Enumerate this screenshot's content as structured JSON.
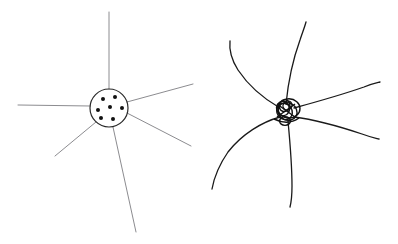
{
  "document": {
    "title": "Hand-drawn node diagram comparison",
    "background_color": "#ffffff",
    "width": 398,
    "height": 244
  },
  "panels": [
    {
      "id": "left-panel",
      "name": "clean-node-diagram",
      "caption": "",
      "description": "Clean thin-line star: circle hub containing seven dots with six straight rays radiating outward",
      "stroke_color": "#8c8c90",
      "stroke_width": 1.0,
      "hub": {
        "name": "hub-circle",
        "cx": 109,
        "cy": 108,
        "r": 19,
        "fill": "none",
        "stroke_color": "#2a2a2a",
        "stroke_width": 1.2
      },
      "dots": {
        "name": "hub-dots",
        "count": 7,
        "radius": 2.0,
        "color": "#111111",
        "points": [
          {
            "cx": 103,
            "cy": 99
          },
          {
            "cx": 115,
            "cy": 97
          },
          {
            "cx": 98,
            "cy": 110
          },
          {
            "cx": 110,
            "cy": 107
          },
          {
            "cx": 122,
            "cy": 108
          },
          {
            "cx": 101,
            "cy": 118
          },
          {
            "cx": 113,
            "cy": 119
          }
        ]
      },
      "rays": [
        {
          "name": "ray-north",
          "x1": 109,
          "y1": 89,
          "x2": 109,
          "y2": 12
        },
        {
          "name": "ray-west",
          "x1": 90,
          "y1": 106,
          "x2": 18,
          "y2": 105
        },
        {
          "name": "ray-northeast",
          "x1": 127,
          "y1": 102,
          "x2": 193,
          "y2": 84
        },
        {
          "name": "ray-east-down",
          "x1": 127,
          "y1": 113,
          "x2": 191,
          "y2": 146
        },
        {
          "name": "ray-southwest",
          "x1": 96,
          "y1": 122,
          "x2": 55,
          "y2": 156
        },
        {
          "name": "ray-south",
          "x1": 113,
          "y1": 127,
          "x2": 136,
          "y2": 232
        }
      ]
    },
    {
      "id": "right-panel",
      "name": "sketchy-node-diagram",
      "caption": "",
      "description": "Messy hand-drawn star: tangled scribbled knot hub with six curved, wobbly strokes radiating outward",
      "stroke_color": "#1a1a1a",
      "stroke_width": 1.3,
      "hub": {
        "name": "hub-knot",
        "cx": 286,
        "cy": 110,
        "r": 11,
        "fill": "none",
        "stroke_color": "#111111",
        "stroke_width": 1.4,
        "scribble_loops": 6
      },
      "rays": [
        {
          "name": "curve-north",
          "d": "M 286 104 C 288 84 292 62 300 40 C 303 31 305 26 306 22"
        },
        {
          "name": "curve-northwest",
          "d": "M 280 108 C 266 100 250 88 238 70 C 231 59 229 50 230 41"
        },
        {
          "name": "curve-northeast",
          "d": "M 294 108 C 316 102 344 94 364 87 C 371 84 376 83 380 82"
        },
        {
          "name": "curve-east",
          "d": "M 294 117 C 318 120 344 128 362 134 C 370 137 375 138 379 139"
        },
        {
          "name": "curve-southwest",
          "d": "M 280 117 C 262 122 242 134 228 152 C 219 165 214 178 212 189"
        },
        {
          "name": "curve-south",
          "d": "M 288 121 C 290 142 292 166 292 186 C 292 198 291 203 290 207"
        }
      ]
    }
  ],
  "legend": {
    "present": false,
    "entries": []
  }
}
